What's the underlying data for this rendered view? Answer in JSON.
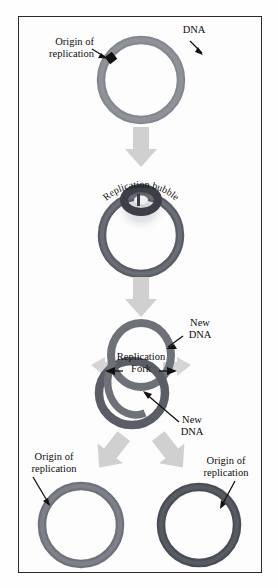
{
  "figure": {
    "background_color": "#fdfdfd",
    "frame_color": "#2b2b2b"
  },
  "colors": {
    "dna_ring_light": "#7c7f86",
    "dna_ring_dark": "#4c4f57",
    "origin_mark": "#111111",
    "arrow_gray": "#cfcfcf",
    "leader_line": "#111111",
    "text": "#0d0d0d"
  },
  "stages": [
    {
      "id": "stage-1",
      "name": "parent-circular-dna",
      "labels": [
        {
          "id": "dna-label",
          "text": "DNA",
          "lines": [
            "DNA"
          ]
        },
        {
          "id": "origin-label",
          "text": "Origin of replication",
          "lines": [
            "Origin of",
            "replication"
          ]
        }
      ]
    },
    {
      "id": "stage-2",
      "name": "replication-bubble",
      "labels": [
        {
          "id": "replication-bubble-label",
          "text": "Replication bubble",
          "curved": true
        }
      ]
    },
    {
      "id": "stage-3",
      "name": "theta-structure",
      "labels": [
        {
          "id": "new-dna-top-label",
          "text": "New DNA",
          "lines": [
            "New",
            "DNA"
          ]
        },
        {
          "id": "replication-fork-label",
          "text": "Replication Fork",
          "lines": [
            "Replication",
            "Fork"
          ]
        },
        {
          "id": "new-dna-bottom-label",
          "text": "New DNA",
          "lines": [
            "New",
            "DNA"
          ]
        }
      ]
    },
    {
      "id": "stage-4",
      "name": "two-daughter-molecules",
      "labels": [
        {
          "id": "origin-label-left",
          "text": "Origin of replication",
          "lines": [
            "Origin of",
            "replication"
          ]
        },
        {
          "id": "origin-label-right",
          "text": "Origin of replication",
          "lines": [
            "Origin of",
            "replication"
          ]
        }
      ]
    }
  ],
  "text": {
    "dna": "DNA",
    "origin_line1": "Origin of",
    "origin_line2": "replication",
    "replication_bubble": "Replication bubble",
    "new_line1": "New",
    "new_line2": "DNA",
    "fork_line1": "Replication",
    "fork_line2": "Fork"
  },
  "arrows": [
    {
      "id": "arrow-stage1-to-stage2",
      "direction": "down"
    },
    {
      "id": "arrow-stage2-to-stage3",
      "direction": "down"
    },
    {
      "id": "arrow-stage3-to-stage4-left",
      "direction": "down-left"
    },
    {
      "id": "arrow-stage3-to-stage4-right",
      "direction": "down-right"
    }
  ]
}
